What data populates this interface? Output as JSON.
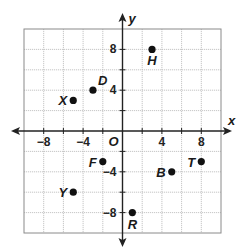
{
  "plane": {
    "x_axis_label": "x",
    "y_axis_label": "y",
    "origin_label": "O",
    "range": {
      "xmin": -10,
      "xmax": 10,
      "ymin": -10,
      "ymax": 10
    },
    "grid_step": 2,
    "x_tick_labels": [
      {
        "value": -8,
        "text": "−8"
      },
      {
        "value": -4,
        "text": "−4"
      },
      {
        "value": 4,
        "text": "4"
      },
      {
        "value": 8,
        "text": "8"
      }
    ],
    "y_tick_labels": [
      {
        "value": 8,
        "text": "8"
      },
      {
        "value": 4,
        "text": "4"
      },
      {
        "value": -4,
        "text": "−4"
      },
      {
        "value": -8,
        "text": "−8"
      }
    ]
  },
  "points": [
    {
      "name": "H",
      "x": 3,
      "y": 8,
      "label_pos": "below"
    },
    {
      "name": "D",
      "x": -3,
      "y": 4,
      "label_pos": "above-right"
    },
    {
      "name": "X",
      "x": -5,
      "y": 3,
      "label_pos": "left"
    },
    {
      "name": "F",
      "x": -2,
      "y": -3,
      "label_pos": "left"
    },
    {
      "name": "Y",
      "x": -5,
      "y": -6,
      "label_pos": "left"
    },
    {
      "name": "B",
      "x": 5,
      "y": -4,
      "label_pos": "left"
    },
    {
      "name": "T",
      "x": 8,
      "y": -3,
      "label_pos": "left"
    },
    {
      "name": "R",
      "x": 1,
      "y": -8,
      "label_pos": "below"
    }
  ],
  "colors": {
    "axis": "#222222",
    "grid": "#b8b8b8",
    "border": "#8a8a8a",
    "point": "#111111"
  }
}
